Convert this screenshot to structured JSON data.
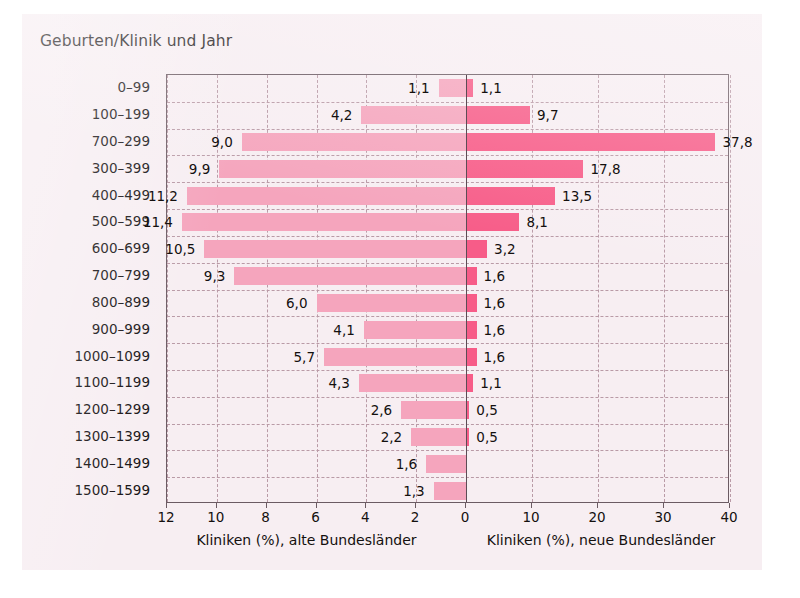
{
  "chart_data": {
    "type": "bar",
    "orientation": "horizontal-diverging",
    "title": "Geburten/Klinik und Jahr",
    "categories": [
      "0–99",
      "100–199",
      "700–299",
      "300–399",
      "400–499",
      "500–599",
      "600–699",
      "700–799",
      "800–899",
      "900–999",
      "1000–1099",
      "1100–1199",
      "1200–1299",
      "1300–1399",
      "1400–1499",
      "1500–1599"
    ],
    "series": [
      {
        "name": "Kliniken (%), alte Bundesländer",
        "side": "left",
        "color": "#f5a5bd",
        "values": [
          1.1,
          4.2,
          9.0,
          9.9,
          11.2,
          11.4,
          10.5,
          9.3,
          6.0,
          4.1,
          5.7,
          4.3,
          2.6,
          2.2,
          1.6,
          1.3
        ],
        "labels": [
          "1,1",
          "4,2",
          "9,0",
          "9,9",
          "11,2",
          "11,4",
          "10,5",
          "9,3",
          "6,0",
          "4,1",
          "5,7",
          "4,3",
          "2,6",
          "2,2",
          "1,6",
          "1,3"
        ]
      },
      {
        "name": "Kliniken (%), neue Bundesländer",
        "side": "right",
        "color": "#f75c88",
        "values": [
          1.1,
          9.7,
          37.8,
          17.8,
          13.5,
          8.1,
          3.2,
          1.6,
          1.6,
          1.6,
          1.6,
          1.1,
          0.5,
          0.5,
          null,
          null
        ],
        "labels": [
          "1,1",
          "9,7",
          "37,8",
          "17,8",
          "13,5",
          "8,1",
          "3,2",
          "1,6",
          "1,6",
          "1,6",
          "1,6",
          "1,1",
          "0,5",
          "0,5",
          "",
          ""
        ]
      }
    ],
    "xlabel_left": "Kliniken (%), alte Bundesländer",
    "xlabel_right": "Kliniken (%), neue Bundesländer",
    "ylabel": "",
    "xticks_left": [
      "12",
      "10",
      "8",
      "6",
      "4",
      "2",
      "0"
    ],
    "xticks_left_values": [
      12,
      10,
      8,
      6,
      4,
      2,
      0
    ],
    "xticks_right": [
      "0",
      "10",
      "20",
      "30",
      "40"
    ],
    "xticks_right_values": [
      0,
      10,
      20,
      30,
      40
    ],
    "xlim_left": [
      12,
      0
    ],
    "xlim_right": [
      0,
      40
    ],
    "grid": true,
    "legend": "none",
    "colors": {
      "left_bar": "#f5a5bd",
      "right_bar": "#f75c88",
      "panel_background": "#f7eef2",
      "grid": "#b99aa6",
      "frame": "#6b5b63",
      "text": "#14100f"
    }
  }
}
